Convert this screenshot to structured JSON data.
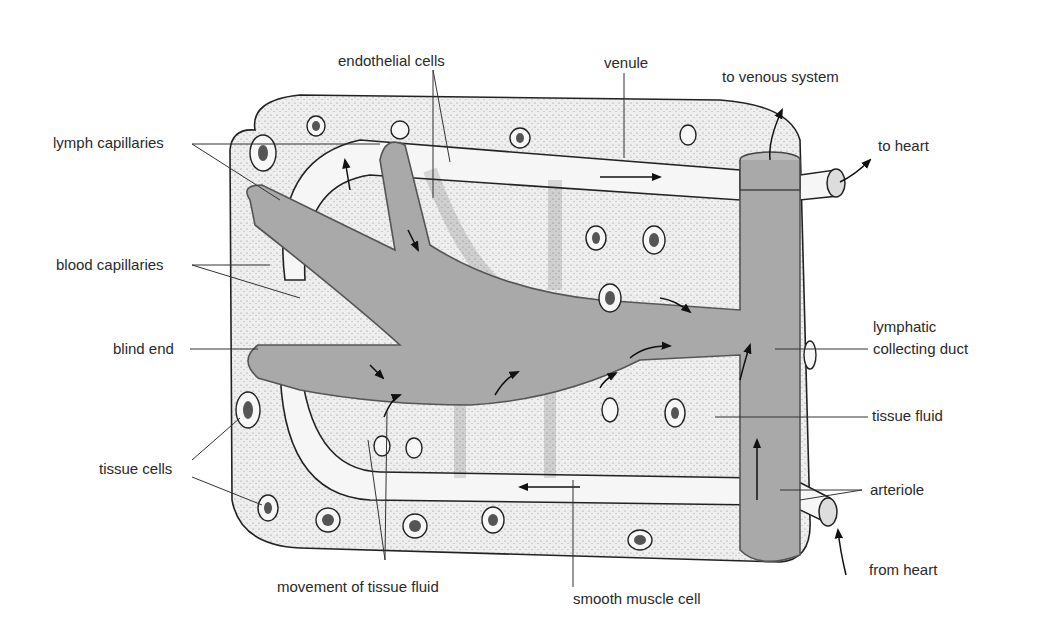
{
  "diagram": {
    "type": "biology-illustration",
    "colors": {
      "tissue_fill": "#ececec",
      "lymph_fill": "#a9a9a9",
      "lymph_stroke": "#555555",
      "vessel_fill": "#f4f4f4",
      "ink": "#222222",
      "label_text": "#2a2a2a",
      "leader_line": "#333333"
    },
    "labels": {
      "endothelial_cells": "endothelial cells",
      "venule": "venule",
      "to_venous_system": "to venous system",
      "to_heart": "to heart",
      "lymph_capillaries": "lymph capillaries",
      "blood_capillaries": "blood capillaries",
      "blind_end": "blind end",
      "lymphatic_line1": "lymphatic",
      "lymphatic_line2": "collecting duct",
      "tissue_fluid": "tissue fluid",
      "tissue_cells": "tissue cells",
      "arteriole": "arteriole",
      "from_heart": "from heart",
      "movement_of_tissue_fluid": "movement of tissue fluid",
      "smooth_muscle_cell": "smooth muscle cell"
    }
  }
}
